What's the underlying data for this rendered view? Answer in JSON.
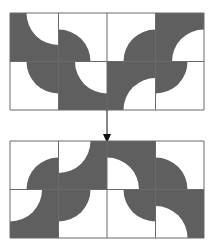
{
  "colors": {
    "fill": "#5f5f5f",
    "background": "#ffffff",
    "grid": "#6a6a6a",
    "arrow": "#111111"
  },
  "diagram": {
    "radius_ratio": 0.66,
    "top_grid": {
      "x": 10,
      "y": 13,
      "cols": 4,
      "rows": 2,
      "cell_w": 48.5,
      "cell_h": 48.5,
      "tiles": [
        {
          "row": 0,
          "col": 0,
          "type": "cutout",
          "corner": "tr"
        },
        {
          "row": 0,
          "col": 1,
          "type": "quarter",
          "corner": "bl"
        },
        {
          "row": 0,
          "col": 2,
          "type": "quarter",
          "corner": "br"
        },
        {
          "row": 0,
          "col": 3,
          "type": "cutout",
          "corner": "br"
        },
        {
          "row": 1,
          "col": 0,
          "type": "quarter",
          "corner": "tr"
        },
        {
          "row": 1,
          "col": 1,
          "type": "cutout",
          "corner": "tr"
        },
        {
          "row": 1,
          "col": 2,
          "type": "cutout",
          "corner": "br"
        },
        {
          "row": 1,
          "col": 3,
          "type": "quarter",
          "corner": "tl"
        }
      ]
    },
    "arrow": {
      "x": 107,
      "y1": 110,
      "y2": 143
    },
    "bottom_grid": {
      "x": 10,
      "y": 141,
      "cols": 4,
      "rows": 2,
      "cell_w": 48.5,
      "cell_h": 48.5,
      "tiles": [
        {
          "row": 0,
          "col": 0,
          "type": "quarter",
          "corner": "br"
        },
        {
          "row": 0,
          "col": 1,
          "type": "cutout",
          "corner": "tl"
        },
        {
          "row": 0,
          "col": 2,
          "type": "cutout",
          "corner": "bl"
        },
        {
          "row": 0,
          "col": 3,
          "type": "quarter",
          "corner": "bl"
        },
        {
          "row": 1,
          "col": 0,
          "type": "cutout",
          "corner": "tl"
        },
        {
          "row": 1,
          "col": 1,
          "type": "quarter",
          "corner": "tl"
        },
        {
          "row": 1,
          "col": 2,
          "type": "quarter",
          "corner": "tr"
        },
        {
          "row": 1,
          "col": 3,
          "type": "cutout",
          "corner": "bl"
        }
      ]
    }
  }
}
